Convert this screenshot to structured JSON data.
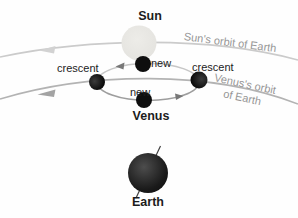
{
  "labels": {
    "sun": "Sun",
    "venus": "Venus",
    "earth": "Earth",
    "crescent_left": "crescent",
    "crescent_right": "crescent",
    "new_top": "new",
    "new_bottom": "new",
    "sun_orbit": "Sun's orbit of Earth",
    "venus_orbit_line1": "Venus's orbit",
    "venus_orbit_line2": "of Earth"
  },
  "colors": {
    "background": "#fefefe",
    "sun_fill": "#e9e8e3",
    "sun_orbit_stroke": "#cbcbcb",
    "sun_orbit_arrow": "#d2d2d2",
    "venus_orbit_stroke": "#b3b3b3",
    "venus_orbit_arrow": "#a3a3a3",
    "epicycle_top_stroke": "#c7c7c7",
    "epicycle_bottom_stroke": "#9e9e9e",
    "epicycle_arrow": "#787878",
    "planet_black": "#0e0e0e",
    "earth_axis": "#3f3f3f",
    "label_dark": "#1c1c1c",
    "orbit_label_gray": "#969696"
  }
}
